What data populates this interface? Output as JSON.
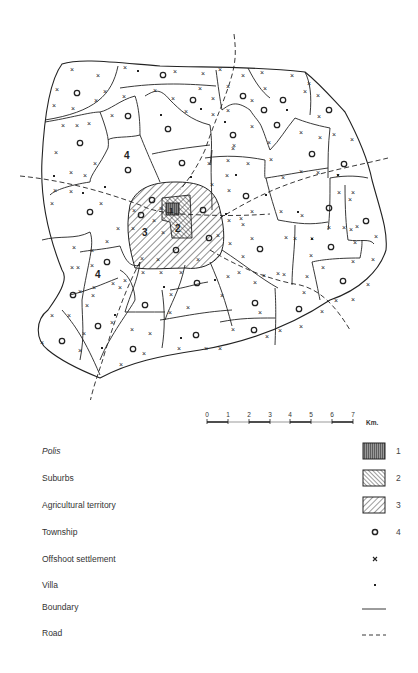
{
  "map": {
    "region_labels": [
      {
        "id": "polis",
        "text": "1"
      },
      {
        "id": "suburbs",
        "text": "2"
      },
      {
        "id": "agricultural",
        "text": "3"
      },
      {
        "id": "township-north",
        "text": "4"
      },
      {
        "id": "township-west",
        "text": "4"
      }
    ]
  },
  "scale": {
    "ticks": [
      "0",
      "1",
      "2",
      "3",
      "4",
      "5",
      "6",
      "7"
    ],
    "unit": "Km."
  },
  "legend": {
    "items": [
      {
        "label": "Polis",
        "symbol": "vertical-hatch-box",
        "number": "1",
        "italic": true
      },
      {
        "label": "Suburbs",
        "symbol": "dense-diagonal-hatch-box",
        "number": "2"
      },
      {
        "label": "Agricultural territory",
        "symbol": "diagonal-hatch-box",
        "number": "3"
      },
      {
        "label": "Township",
        "symbol": "circle",
        "number": "4"
      },
      {
        "label": "Offshoot settlement",
        "symbol": "cross",
        "number": ""
      },
      {
        "label": "Villa",
        "symbol": "dot",
        "number": ""
      },
      {
        "label": "Boundary",
        "symbol": "solid-line",
        "number": ""
      },
      {
        "label": "Road",
        "symbol": "dashed-line",
        "number": ""
      }
    ]
  },
  "colors": {
    "ink": "#222222",
    "polis_fill": "#666666",
    "background": "#ffffff"
  }
}
